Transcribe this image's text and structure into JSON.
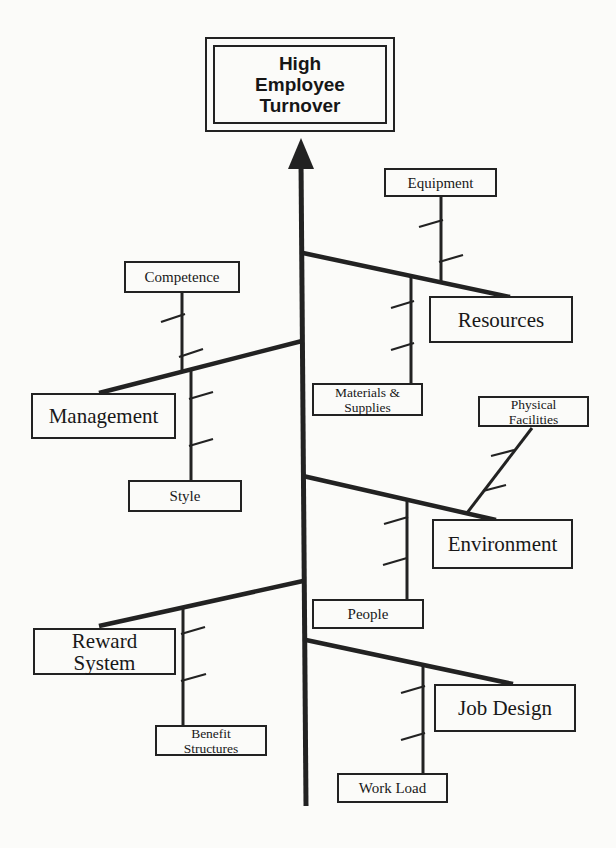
{
  "page": {
    "bg": "#fbfbf9",
    "ink": "#222222"
  },
  "diagram": {
    "type": "fishbone-cause-effect",
    "effect": {
      "id": "high-employee-turnover",
      "lines": [
        "High",
        "Employee",
        "Turnover"
      ],
      "box": {
        "x": 205,
        "y": 37,
        "w": 190,
        "h": 95
      }
    },
    "spine": {
      "x1": 301,
      "y1": 160,
      "x2": 306,
      "y2": 806,
      "stroke_w": 5
    },
    "arrowhead_points": "301,138 288,169 314,169",
    "branches": [
      {
        "id": "resources",
        "x1": 303,
        "y1": 253,
        "x2": 510,
        "y2": 297
      },
      {
        "id": "management",
        "x1": 302,
        "y1": 341,
        "x2": 99,
        "y2": 393
      },
      {
        "id": "environment",
        "x1": 303,
        "y1": 476,
        "x2": 496,
        "y2": 520
      },
      {
        "id": "reward-system",
        "x1": 303,
        "y1": 581,
        "x2": 99,
        "y2": 626
      },
      {
        "id": "job-design",
        "x1": 306,
        "y1": 640,
        "x2": 513,
        "y2": 684
      }
    ],
    "connectors": [
      {
        "id": "equipment",
        "x1": 441,
        "y1": 196,
        "x2": 441,
        "y2": 283
      },
      {
        "id": "materials-supplies",
        "x1": 411,
        "y1": 276,
        "x2": 411,
        "y2": 384
      },
      {
        "id": "competence",
        "x1": 182,
        "y1": 293,
        "x2": 182,
        "y2": 372
      },
      {
        "id": "style",
        "x1": 191,
        "y1": 369,
        "x2": 191,
        "y2": 481
      },
      {
        "id": "physical-facilities",
        "x1": 532,
        "y1": 428,
        "x2": 467,
        "y2": 513
      },
      {
        "id": "people",
        "x1": 407,
        "y1": 500,
        "x2": 407,
        "y2": 600
      },
      {
        "id": "benefit-structures",
        "x1": 183,
        "y1": 608,
        "x2": 183,
        "y2": 726
      },
      {
        "id": "work-load",
        "x1": 423,
        "y1": 665,
        "x2": 423,
        "y2": 774
      }
    ],
    "ticks": [
      [
        419,
        227,
        443,
        220
      ],
      [
        439,
        262,
        463,
        255
      ],
      [
        391,
        308,
        414,
        301
      ],
      [
        391,
        350,
        414,
        343
      ],
      [
        161,
        322,
        185,
        314
      ],
      [
        179,
        357,
        203,
        349
      ],
      [
        189,
        399,
        213,
        392
      ],
      [
        189,
        446,
        213,
        439
      ],
      [
        491,
        456,
        514,
        450
      ],
      [
        483,
        491,
        506,
        485
      ],
      [
        384,
        524,
        408,
        517
      ],
      [
        383,
        565,
        407,
        558
      ],
      [
        181,
        634,
        205,
        627
      ],
      [
        181,
        681,
        206,
        674
      ],
      [
        401,
        693,
        425,
        686
      ],
      [
        401,
        740,
        425,
        733
      ]
    ],
    "category_boxes": [
      {
        "id": "resources",
        "lines": [
          "Resources"
        ],
        "x": 429,
        "y": 296,
        "w": 144,
        "h": 47
      },
      {
        "id": "management",
        "lines": [
          "Management"
        ],
        "x": 31,
        "y": 393,
        "w": 145,
        "h": 46
      },
      {
        "id": "environment",
        "lines": [
          "Environment"
        ],
        "x": 432,
        "y": 519,
        "w": 141,
        "h": 50
      },
      {
        "id": "reward-system",
        "lines": [
          "Reward",
          "System"
        ],
        "x": 33,
        "y": 628,
        "w": 143,
        "h": 47
      },
      {
        "id": "job-design",
        "lines": [
          "Job Design"
        ],
        "x": 434,
        "y": 684,
        "w": 142,
        "h": 48
      }
    ],
    "cause_boxes": [
      {
        "id": "equipment",
        "lines": [
          "Equipment"
        ],
        "x": 384,
        "y": 168,
        "w": 113,
        "h": 29
      },
      {
        "id": "competence",
        "lines": [
          "Competence"
        ],
        "x": 124,
        "y": 261,
        "w": 116,
        "h": 32
      },
      {
        "id": "materials-supplies",
        "lines": [
          "Materials &",
          "Supplies"
        ],
        "x": 312,
        "y": 383,
        "w": 111,
        "h": 33
      },
      {
        "id": "physical-facilities",
        "lines": [
          "Physical",
          "Facilities"
        ],
        "x": 478,
        "y": 396,
        "w": 111,
        "h": 31
      },
      {
        "id": "style",
        "lines": [
          "Style"
        ],
        "x": 128,
        "y": 480,
        "w": 114,
        "h": 32
      },
      {
        "id": "people",
        "lines": [
          "People"
        ],
        "x": 312,
        "y": 599,
        "w": 112,
        "h": 30
      },
      {
        "id": "benefit-structures",
        "lines": [
          "Benefit",
          "Structures"
        ],
        "x": 155,
        "y": 725,
        "w": 112,
        "h": 31
      },
      {
        "id": "work-load",
        "lines": [
          "Work Load"
        ],
        "x": 337,
        "y": 773,
        "w": 111,
        "h": 30
      }
    ],
    "structure": [
      {
        "category": "Resources",
        "causes": [
          "Equipment",
          "Materials & Supplies"
        ]
      },
      {
        "category": "Management",
        "causes": [
          "Competence",
          "Style"
        ]
      },
      {
        "category": "Environment",
        "causes": [
          "Physical Facilities",
          "People"
        ]
      },
      {
        "category": "Reward System",
        "causes": [
          "Benefit Structures"
        ]
      },
      {
        "category": "Job Design",
        "causes": [
          "Work Load"
        ]
      }
    ]
  }
}
